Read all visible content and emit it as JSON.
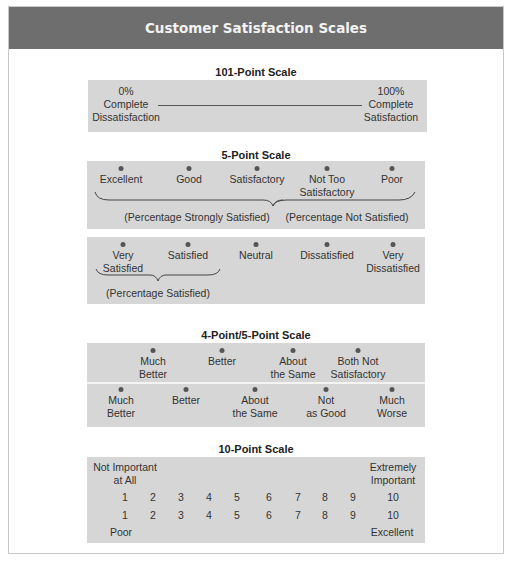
{
  "title": "Customer Satisfaction Scales",
  "scale101": {
    "title": "101-Point Scale",
    "left": [
      "0%",
      "Complete",
      "Dissatisfaction"
    ],
    "right": [
      "100%",
      "Complete",
      "Satisfaction"
    ]
  },
  "scale5": {
    "title": "5-Point Scale",
    "row1": {
      "points": [
        {
          "label": [
            "Excellent"
          ]
        },
        {
          "label": [
            "Good"
          ]
        },
        {
          "label": [
            "Satisfactory"
          ]
        },
        {
          "label": [
            "Not Too",
            "Satisfactory"
          ]
        },
        {
          "label": [
            "Poor"
          ]
        }
      ],
      "brace_left_caption": "(Percentage Strongly Satisfied)",
      "brace_right_caption": "(Percentage Not Satisfied)"
    },
    "row2": {
      "points": [
        {
          "label": [
            "Very",
            "Satisfied"
          ]
        },
        {
          "label": [
            "Satisfied"
          ]
        },
        {
          "label": [
            "Neutral"
          ]
        },
        {
          "label": [
            "Dissatisfied"
          ]
        },
        {
          "label": [
            "Very",
            "Dissatisfied"
          ]
        }
      ],
      "brace_caption": "(Percentage Satisfied)"
    }
  },
  "scale45": {
    "title": "4-Point/5-Point Scale",
    "row1": [
      {
        "label": [
          "Much",
          "Better"
        ]
      },
      {
        "label": [
          "Better"
        ]
      },
      {
        "label": [
          "About",
          "the Same"
        ]
      },
      {
        "label": [
          "Both Not",
          "Satisfactory"
        ]
      }
    ],
    "row2": [
      {
        "label": [
          "Much",
          "Better"
        ]
      },
      {
        "label": [
          "Better"
        ]
      },
      {
        "label": [
          "About",
          "the Same"
        ]
      },
      {
        "label": [
          "Not",
          "as Good"
        ]
      },
      {
        "label": [
          "Much",
          "Worse"
        ]
      }
    ]
  },
  "scale10": {
    "title": "10-Point Scale",
    "top_left": [
      "Not Important",
      "at All"
    ],
    "top_right": [
      "Extremely",
      "Important"
    ],
    "numbers_row1": [
      "1",
      "2",
      "3",
      "4",
      "5",
      "6",
      "7",
      "8",
      "9",
      "10"
    ],
    "numbers_row2": [
      "1",
      "2",
      "3",
      "4",
      "5",
      "6",
      "7",
      "8",
      "9",
      "10"
    ],
    "bottom_left": "Poor",
    "bottom_right": "Excellent"
  },
  "colors": {
    "header_bg": "#6e6e6e",
    "box_bg": "#d6d6d6",
    "dot": "#555555"
  }
}
